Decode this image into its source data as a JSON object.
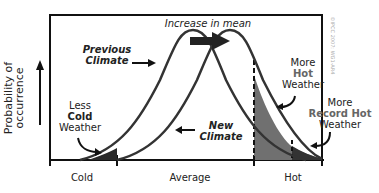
{
  "title": "Increase in mean",
  "y_axis_label": "Probability of occurrence",
  "x_axis": {
    "ticks": [
      "Cold",
      "Average",
      "Hot"
    ]
  },
  "curves": [
    {
      "name": "Previous Climate",
      "label_line1": "Previous",
      "label_line2": "Climate"
    },
    {
      "name": "New Climate",
      "label_line1": "New",
      "label_line2": "Climate"
    }
  ],
  "annotations": {
    "less_cold": {
      "line1": "Less",
      "line2": "Cold",
      "line3": "Weather"
    },
    "more_hot": {
      "line1": "More",
      "line2": "Hot",
      "line3": "Weather"
    },
    "more_record_hot": {
      "line1": "More",
      "line2": "Record Hot",
      "line3": "Weather"
    }
  },
  "credit": "©IPCC 2007: WG1-AR4",
  "colors": {
    "curve": "#333333",
    "hot_fill": "#6e6e6e",
    "record_fill": "#333333",
    "cold_fill": "#2a2a2a"
  }
}
